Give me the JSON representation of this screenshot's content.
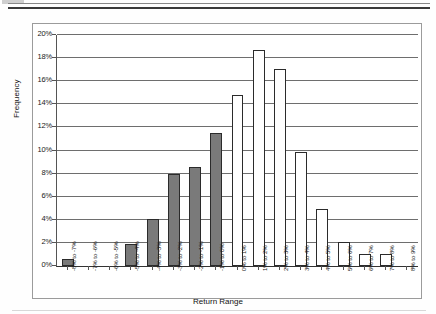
{
  "chart_data": {
    "type": "bar",
    "title": "",
    "xlabel": "Return Range",
    "ylabel": "Frequency",
    "ylim": [
      0,
      20
    ],
    "ytick_labels": [
      "0%",
      "2%",
      "4%",
      "6%",
      "8%",
      "10%",
      "12%",
      "14%",
      "16%",
      "18%",
      "20%"
    ],
    "ytick_values": [
      0,
      2,
      4,
      6,
      8,
      10,
      12,
      14,
      16,
      18,
      20
    ],
    "grid": true,
    "legend": "none",
    "categories": [
      "-8% to -7%",
      "-7% to -6%",
      "-6% to -5%",
      "-5% to -4%",
      "-4% to -3%",
      "-3% to -2%",
      "-2% to -1%",
      "-1% to 0%",
      "0% to 1%",
      "1% to 2%",
      "2% to 3%",
      "3% to 4%",
      "4% to 5%",
      "5% to 6%",
      "6% to 7%",
      "7% to 8%",
      "8% to 9%"
    ],
    "values": [
      0.6,
      0.0,
      0.0,
      1.9,
      4.1,
      8.0,
      8.6,
      11.5,
      14.8,
      18.7,
      17.1,
      9.9,
      4.9,
      2.1,
      1.0,
      1.0,
      0.0
    ],
    "bar_styles": [
      "neg",
      "neg",
      "neg",
      "neg",
      "neg",
      "neg",
      "neg",
      "neg",
      "pos",
      "pos",
      "pos",
      "pos",
      "pos",
      "pos",
      "pos",
      "pos",
      "pos"
    ],
    "colors": {
      "negative_bar_fill": "#7a7a7a",
      "positive_bar_fill": "#ffffff",
      "bar_border": "#2b2b2b",
      "gridline": "#6e6e6e",
      "axis": "#333333",
      "frame": "#9b9b9b"
    }
  }
}
